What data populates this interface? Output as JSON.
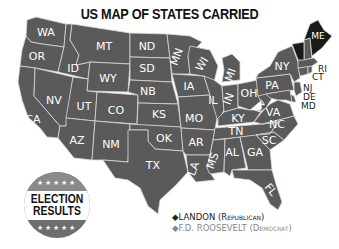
{
  "title": "US MAP OF STATES CARRIED",
  "badge": {
    "line1": "ELECTION",
    "line2": "RESULTS",
    "stars_top": "★★★★★",
    "stars_bottom": "★★★★★"
  },
  "legend": {
    "items": [
      {
        "marker": "◆",
        "name": "LANDON",
        "party": "(Republican)",
        "color": "#222222"
      },
      {
        "marker": "◆",
        "name": "F.D. ROOSEVELT",
        "party": "(Democrat)",
        "color": "#888888"
      }
    ]
  },
  "colors": {
    "democrat_fill": "#5a5a5a",
    "republican_fill": "#1a1a1a",
    "border": "#d8d8d8"
  },
  "states": [
    {
      "abbr": "WA",
      "winner": "Roosevelt"
    },
    {
      "abbr": "OR",
      "winner": "Roosevelt"
    },
    {
      "abbr": "CA",
      "winner": "Roosevelt"
    },
    {
      "abbr": "ID",
      "winner": "Roosevelt"
    },
    {
      "abbr": "NV",
      "winner": "Roosevelt"
    },
    {
      "abbr": "MT",
      "winner": "Roosevelt"
    },
    {
      "abbr": "WY",
      "winner": "Roosevelt"
    },
    {
      "abbr": "UT",
      "winner": "Roosevelt"
    },
    {
      "abbr": "CO",
      "winner": "Roosevelt"
    },
    {
      "abbr": "AZ",
      "winner": "Roosevelt"
    },
    {
      "abbr": "NM",
      "winner": "Roosevelt"
    },
    {
      "abbr": "ND",
      "winner": "Roosevelt"
    },
    {
      "abbr": "SD",
      "winner": "Roosevelt"
    },
    {
      "abbr": "NB",
      "winner": "Roosevelt"
    },
    {
      "abbr": "KS",
      "winner": "Roosevelt"
    },
    {
      "abbr": "OK",
      "winner": "Roosevelt"
    },
    {
      "abbr": "TX",
      "winner": "Roosevelt"
    },
    {
      "abbr": "MN",
      "winner": "Roosevelt"
    },
    {
      "abbr": "IA",
      "winner": "Roosevelt"
    },
    {
      "abbr": "MO",
      "winner": "Roosevelt"
    },
    {
      "abbr": "AR",
      "winner": "Roosevelt"
    },
    {
      "abbr": "LA",
      "winner": "Roosevelt"
    },
    {
      "abbr": "WI",
      "winner": "Roosevelt"
    },
    {
      "abbr": "IL",
      "winner": "Roosevelt"
    },
    {
      "abbr": "MI",
      "winner": "Roosevelt"
    },
    {
      "abbr": "IN",
      "winner": "Roosevelt"
    },
    {
      "abbr": "OH",
      "winner": "Roosevelt"
    },
    {
      "abbr": "KY",
      "winner": "Roosevelt"
    },
    {
      "abbr": "TN",
      "winner": "Roosevelt"
    },
    {
      "abbr": "MS",
      "winner": "Roosevelt"
    },
    {
      "abbr": "AL",
      "winner": "Roosevelt"
    },
    {
      "abbr": "GA",
      "winner": "Roosevelt"
    },
    {
      "abbr": "FL",
      "winner": "Roosevelt"
    },
    {
      "abbr": "SC",
      "winner": "Roosevelt"
    },
    {
      "abbr": "NC",
      "winner": "Roosevelt"
    },
    {
      "abbr": "VA",
      "winner": "Roosevelt"
    },
    {
      "abbr": "WV",
      "winner": "Roosevelt"
    },
    {
      "abbr": "PA",
      "winner": "Roosevelt"
    },
    {
      "abbr": "NY",
      "winner": "Roosevelt"
    },
    {
      "abbr": "NJ",
      "winner": "Roosevelt"
    },
    {
      "abbr": "DE",
      "winner": "Roosevelt"
    },
    {
      "abbr": "MD",
      "winner": "Roosevelt"
    },
    {
      "abbr": "CT",
      "winner": "Roosevelt"
    },
    {
      "abbr": "RI",
      "winner": "Roosevelt"
    },
    {
      "abbr": "MA",
      "winner": "Roosevelt"
    },
    {
      "abbr": "NH",
      "winner": "Roosevelt"
    },
    {
      "abbr": "VT",
      "winner": "Landon"
    },
    {
      "abbr": "ME",
      "winner": "Landon"
    }
  ],
  "labels": {
    "WA": "WA",
    "OR": "OR",
    "CA": "CA",
    "ID": "ID",
    "NV": "NV",
    "MT": "MT",
    "WY": "WY",
    "UT": "UT",
    "CO": "CO",
    "AZ": "AZ",
    "NM": "NM",
    "ND": "ND",
    "SD": "SD",
    "NB": "NB",
    "KS": "KS",
    "OK": "OK",
    "TX": "TX",
    "MN": "MN",
    "IA": "IA",
    "MO": "MO",
    "AR": "AR",
    "LA": "LA",
    "WI": "WI",
    "IL": "IL",
    "MI": "MI",
    "IN": "IN",
    "OH": "OH",
    "KY": "KY",
    "TN": "TN",
    "MS": "MS",
    "AL": "AL",
    "GA": "GA",
    "FL": "FL",
    "SC": "SC",
    "NC": "NC",
    "VA": "VA",
    "WV": "WV",
    "PA": "PA",
    "NY": "NY",
    "NJ": "NJ",
    "DE": "DE",
    "MD": "MD",
    "CT": "CT",
    "RI": "RI",
    "ME": "ME"
  }
}
